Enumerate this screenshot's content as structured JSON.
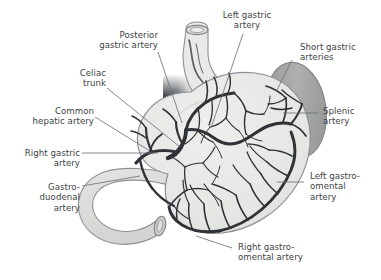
{
  "figure": {
    "background_color": "#ffffff",
    "text_color": "#3b3f45",
    "leader_line_color": "#6e737a",
    "artery_color": "#2f3338",
    "stomach_fill": "#e8e8e6",
    "stomach_outline": "#8d9097",
    "spleen_fill": "#a9abab",
    "spleen_outline": "#7c7f83",
    "duodenum_fill": "#dcdedc",
    "aorta_dark": "#4a4e52",
    "aorta_light": "#e9eaea"
  },
  "labels": {
    "posterior_gastric_artery": "Posterior\ngastric artery",
    "left_gastric_artery": "Left gastric\nartery",
    "short_gastric_arteries": "Short gastric\narteries",
    "celiac_trunk": "Celiac\ntrunk",
    "common_hepatic_artery": "Common\nhepatic artery",
    "splenic_artery": "Splenic\nartery",
    "right_gastric_artery": "Right gastric\nartery",
    "gastroduodenal_artery": "Gastro-\nduodenal\nartery",
    "left_gastroomental_artery": "Left gastro-\nomental\nartery",
    "right_gastroomental_artery": "Right gastro-\nomental artery"
  },
  "structures": {
    "esophagus": "esophagus",
    "stomach": "stomach",
    "spleen": "spleen",
    "duodenum": "duodenum",
    "abdominal_aorta": "abdominal-aorta"
  }
}
